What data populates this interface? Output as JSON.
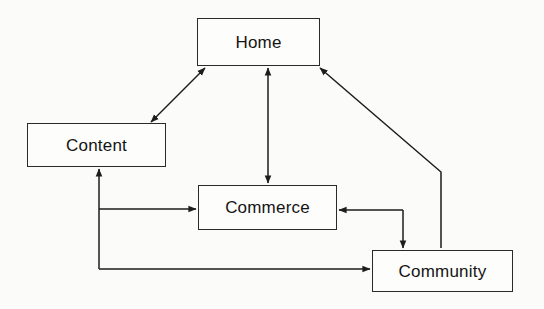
{
  "diagram": {
    "background_color": "#fbfbf9",
    "line_color": "#1d1d1d",
    "box_fill": "#fdfdfb",
    "box_border_color": "#2a2a2a",
    "text_color": "#141414",
    "nodes": [
      {
        "id": "home",
        "label": "Home",
        "x": 197,
        "y": 18,
        "w": 123,
        "h": 48
      },
      {
        "id": "content",
        "label": "Content",
        "x": 27,
        "y": 123,
        "w": 139,
        "h": 44
      },
      {
        "id": "commerce",
        "label": "Commerce",
        "x": 198,
        "y": 185,
        "w": 139,
        "h": 45
      },
      {
        "id": "community",
        "label": "Community",
        "x": 372,
        "y": 250,
        "w": 141,
        "h": 42
      }
    ],
    "edges": [
      {
        "id": "home-content",
        "from": "Home",
        "to": "Content",
        "style": "diagonal",
        "arrows": "both"
      },
      {
        "id": "home-commerce",
        "from": "Home",
        "to": "Commerce",
        "style": "vertical",
        "arrows": "both"
      },
      {
        "id": "community-home",
        "from": "Community",
        "to": "Home",
        "style": "elbow",
        "arrows": "to-home"
      },
      {
        "id": "commerce-community",
        "from": "Commerce",
        "to": "Community",
        "style": "elbow",
        "arrows": "to-community"
      },
      {
        "id": "community-commerce",
        "from": "Community",
        "to": "Commerce",
        "style": "elbow",
        "arrows": "to-commerce"
      },
      {
        "id": "content-commerce",
        "from": "Content",
        "to": "Commerce",
        "style": "elbow",
        "arrows": "to-commerce"
      },
      {
        "id": "content-community",
        "from": "Content",
        "to": "Community",
        "style": "elbow",
        "arrows": "to-community"
      },
      {
        "id": "commerce-content",
        "from": "Commerce",
        "to": "Content",
        "style": "elbow",
        "arrows": "to-content"
      }
    ]
  }
}
